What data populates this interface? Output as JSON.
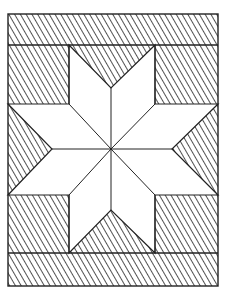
{
  "figure": {
    "colors": {
      "background": "#ffffff",
      "line": "#222222",
      "hatch": "#333333",
      "star_fill": "#ffffff"
    },
    "frame": {
      "x": 8,
      "y": 14,
      "width": 210,
      "height": 272
    },
    "bands": [
      {
        "name": "top-band",
        "x": 8,
        "y": 14,
        "width": 210,
        "height": 31
      },
      {
        "name": "bottom-band",
        "x": 8,
        "y": 253,
        "width": 210,
        "height": 33
      }
    ],
    "corner_blocks": [
      {
        "name": "top-left",
        "x": 8,
        "y": 45,
        "width": 61,
        "height": 59
      },
      {
        "name": "top-right",
        "x": 155,
        "y": 45,
        "width": 63,
        "height": 59
      },
      {
        "name": "bottom-left",
        "x": 8,
        "y": 195,
        "width": 61,
        "height": 58
      },
      {
        "name": "bottom-right",
        "x": 155,
        "y": 195,
        "width": 63,
        "height": 58
      }
    ],
    "side_triangles": [
      {
        "name": "top",
        "points": "69,45 155,45 111,88"
      },
      {
        "name": "bottom",
        "points": "69,253 155,253 111,210"
      },
      {
        "name": "left",
        "points": "8,104 8,195 52,149"
      },
      {
        "name": "right",
        "points": "218,104 218,195 172,149"
      }
    ],
    "star": {
      "center": [
        111,
        149
      ],
      "outline": "69,45 111,88 155,45 155,104 218,104 172,149 218,195 155,195 155,253 111,210 69,253 69,195 8,195 52,149 8,104 69,104",
      "points": 8
    }
  }
}
